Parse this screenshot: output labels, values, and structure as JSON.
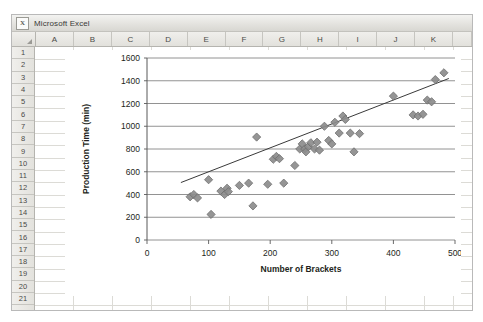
{
  "window": {
    "title": "Microsoft Excel",
    "app_icon": "excel-icon",
    "icon_glyph": "X"
  },
  "spreadsheet": {
    "corner_select_all": "select-all-corner",
    "columns": [
      "A",
      "B",
      "C",
      "D",
      "E",
      "F",
      "G",
      "H",
      "I",
      "J",
      "K"
    ],
    "rows": [
      "1",
      "2",
      "3",
      "4",
      "5",
      "6",
      "7",
      "8",
      "9",
      "10",
      "11",
      "12",
      "13",
      "14",
      "15",
      "16",
      "17",
      "18",
      "19",
      "20",
      "21"
    ]
  },
  "colors": {
    "marker_fill": "#8c8c8c",
    "marker_stroke": "#6e6e6e",
    "gridline": "#868686",
    "axis": "#595959",
    "trendline": "#3a3a3a",
    "text": "#231f20"
  },
  "chart_data": {
    "type": "scatter",
    "title": "",
    "xlabel": "Number of Brackets",
    "ylabel": "Production Time (min)",
    "xlim": [
      0,
      500
    ],
    "ylim": [
      0,
      1600
    ],
    "xticks": [
      0,
      100,
      200,
      300,
      400,
      500
    ],
    "yticks": [
      0,
      200,
      400,
      600,
      800,
      1000,
      1200,
      1400,
      1600
    ],
    "grid": "horizontal",
    "legend": "none",
    "marker": "diamond",
    "trendline": {
      "type": "linear",
      "visible": true,
      "x": [
        55,
        490
      ],
      "y": [
        505,
        1420
      ]
    },
    "points": [
      {
        "x": 70,
        "y": 380
      },
      {
        "x": 76,
        "y": 400
      },
      {
        "x": 82,
        "y": 370
      },
      {
        "x": 100,
        "y": 530
      },
      {
        "x": 104,
        "y": 225
      },
      {
        "x": 120,
        "y": 430
      },
      {
        "x": 126,
        "y": 400
      },
      {
        "x": 130,
        "y": 455
      },
      {
        "x": 132,
        "y": 425
      },
      {
        "x": 150,
        "y": 480
      },
      {
        "x": 165,
        "y": 500
      },
      {
        "x": 172,
        "y": 300
      },
      {
        "x": 178,
        "y": 905
      },
      {
        "x": 196,
        "y": 490
      },
      {
        "x": 205,
        "y": 710
      },
      {
        "x": 210,
        "y": 735
      },
      {
        "x": 215,
        "y": 715
      },
      {
        "x": 222,
        "y": 500
      },
      {
        "x": 240,
        "y": 655
      },
      {
        "x": 248,
        "y": 800
      },
      {
        "x": 252,
        "y": 845
      },
      {
        "x": 256,
        "y": 800
      },
      {
        "x": 258,
        "y": 775
      },
      {
        "x": 262,
        "y": 820
      },
      {
        "x": 266,
        "y": 855
      },
      {
        "x": 272,
        "y": 800
      },
      {
        "x": 276,
        "y": 860
      },
      {
        "x": 280,
        "y": 790
      },
      {
        "x": 288,
        "y": 1000
      },
      {
        "x": 295,
        "y": 875
      },
      {
        "x": 300,
        "y": 845
      },
      {
        "x": 305,
        "y": 1035
      },
      {
        "x": 312,
        "y": 940
      },
      {
        "x": 318,
        "y": 1090
      },
      {
        "x": 322,
        "y": 1060
      },
      {
        "x": 330,
        "y": 940
      },
      {
        "x": 336,
        "y": 775
      },
      {
        "x": 345,
        "y": 935
      },
      {
        "x": 400,
        "y": 1265
      },
      {
        "x": 432,
        "y": 1100
      },
      {
        "x": 440,
        "y": 1090
      },
      {
        "x": 448,
        "y": 1105
      },
      {
        "x": 455,
        "y": 1230
      },
      {
        "x": 462,
        "y": 1215
      },
      {
        "x": 468,
        "y": 1410
      },
      {
        "x": 482,
        "y": 1470
      }
    ]
  }
}
